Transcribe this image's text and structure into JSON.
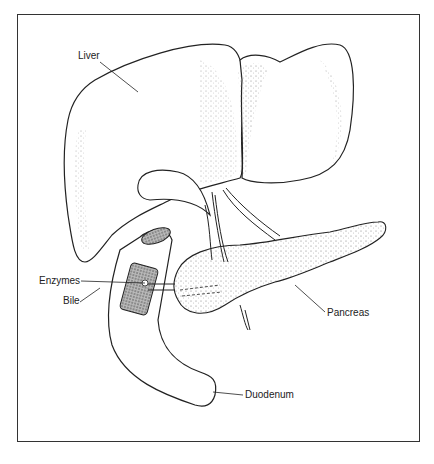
{
  "diagram": {
    "labels": {
      "liver": "Liver",
      "enzymes": "Enzymes",
      "bile": "Bile",
      "pancreas": "Pancreas",
      "duodenum": "Duodenum"
    },
    "colors": {
      "line": "#222222",
      "background": "#ffffff",
      "shade": "#555555"
    }
  }
}
